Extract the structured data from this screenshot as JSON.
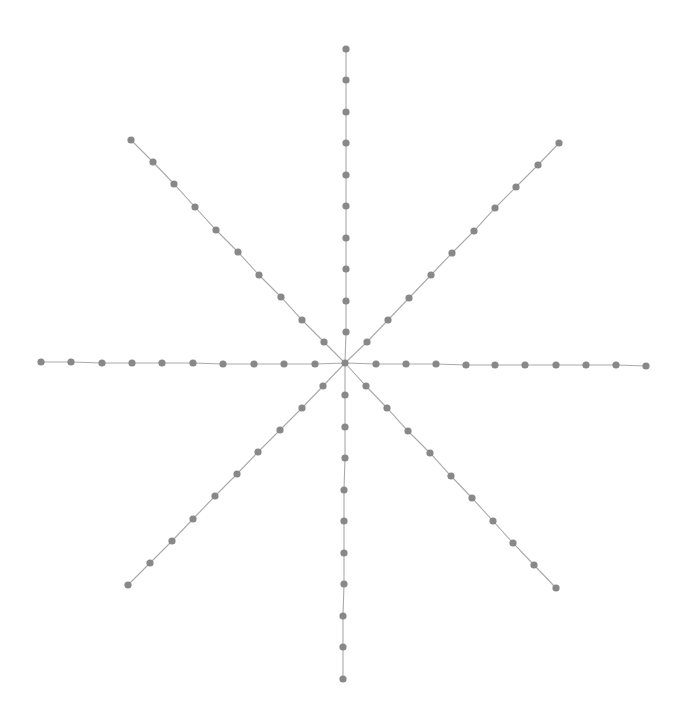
{
  "diagram": {
    "type": "star-graph",
    "width": 684,
    "height": 728,
    "style": {
      "background": "#ffffff",
      "node_color": "#888888",
      "edge_color": "#aaaaaa",
      "node_radius": 3.6,
      "edge_width": 1.1
    },
    "center": {
      "x": 345,
      "y": 363
    },
    "arms": [
      {
        "name": "north",
        "nodes": [
          [
            346,
            332
          ],
          [
            346,
            301
          ],
          [
            346,
            269
          ],
          [
            346,
            238
          ],
          [
            346,
            206
          ],
          [
            346,
            175
          ],
          [
            346,
            143
          ],
          [
            346,
            112
          ],
          [
            346,
            80
          ],
          [
            346,
            49
          ]
        ]
      },
      {
        "name": "south",
        "nodes": [
          [
            345,
            395
          ],
          [
            345,
            427
          ],
          [
            345,
            458
          ],
          [
            344,
            490
          ],
          [
            344,
            521
          ],
          [
            344,
            553
          ],
          [
            344,
            584
          ],
          [
            343,
            616
          ],
          [
            343,
            647
          ],
          [
            343,
            679
          ]
        ]
      },
      {
        "name": "west",
        "nodes": [
          [
            315,
            364
          ],
          [
            284,
            364
          ],
          [
            254,
            364
          ],
          [
            223,
            364
          ],
          [
            193,
            363
          ],
          [
            162,
            363
          ],
          [
            132,
            363
          ],
          [
            102,
            363
          ],
          [
            71,
            362
          ],
          [
            41,
            362
          ]
        ]
      },
      {
        "name": "east",
        "nodes": [
          [
            376,
            364
          ],
          [
            406,
            364
          ],
          [
            436,
            364
          ],
          [
            466,
            365
          ],
          [
            495,
            365
          ],
          [
            525,
            365
          ],
          [
            556,
            365
          ],
          [
            586,
            365
          ],
          [
            616,
            365
          ],
          [
            646,
            366
          ]
        ]
      },
      {
        "name": "north-west",
        "nodes": [
          [
            324,
            342
          ],
          [
            302,
            320
          ],
          [
            281,
            297
          ],
          [
            259,
            275
          ],
          [
            238,
            252
          ],
          [
            216,
            230
          ],
          [
            195,
            207
          ],
          [
            174,
            184
          ],
          [
            153,
            162
          ],
          [
            131,
            140
          ]
        ]
      },
      {
        "name": "north-east",
        "nodes": [
          [
            367,
            342
          ],
          [
            388,
            320
          ],
          [
            409,
            298
          ],
          [
            431,
            275
          ],
          [
            452,
            253
          ],
          [
            474,
            231
          ],
          [
            495,
            208
          ],
          [
            516,
            187
          ],
          [
            538,
            165
          ],
          [
            559,
            143
          ]
        ]
      },
      {
        "name": "south-west",
        "nodes": [
          [
            323,
            386
          ],
          [
            302,
            408
          ],
          [
            280,
            430
          ],
          [
            258,
            452
          ],
          [
            237,
            474
          ],
          [
            215,
            496
          ],
          [
            193,
            519
          ],
          [
            172,
            541
          ],
          [
            150,
            563
          ],
          [
            128,
            585
          ]
        ]
      },
      {
        "name": "south-east",
        "nodes": [
          [
            366,
            386
          ],
          [
            387,
            408
          ],
          [
            408,
            431
          ],
          [
            430,
            453
          ],
          [
            451,
            476
          ],
          [
            472,
            498
          ],
          [
            493,
            521
          ],
          [
            513,
            543
          ],
          [
            534,
            565
          ],
          [
            556,
            588
          ]
        ]
      }
    ]
  }
}
